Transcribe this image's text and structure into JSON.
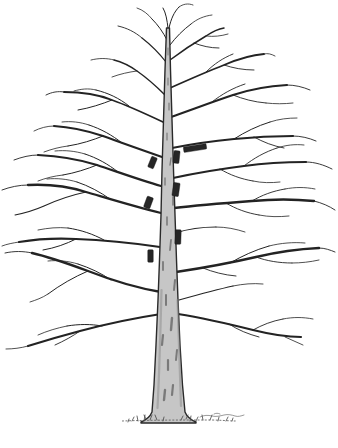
{
  "illustration": {
    "name": "bare-deciduous-tree-pen-and-ink",
    "subject": "leafless tree with dark rectangular placement tags on trunk and branches"
  },
  "colors": {
    "paper": "#ffffff",
    "ink": "#232323",
    "trunk_fill": "#c6c6c6",
    "trunk_edge": "#2a2a2a",
    "bark_shadow": "#3c3c3c",
    "marker_fill": "#262626",
    "ground": "#555555"
  },
  "markers": [
    {
      "id": "branch-bar-right",
      "x": 195,
      "y": 148,
      "width": 23,
      "height": 5.5,
      "angle": -9
    },
    {
      "id": "trunk-right-upper",
      "x": 176.5,
      "y": 157,
      "width": 6,
      "height": 12.5,
      "angle": 6
    },
    {
      "id": "left-upper",
      "x": 152.5,
      "y": 162.5,
      "width": 6,
      "height": 11.5,
      "angle": 22
    },
    {
      "id": "trunk-right-mid",
      "x": 176,
      "y": 189.5,
      "width": 6.5,
      "height": 13.5,
      "angle": 8
    },
    {
      "id": "left-mid",
      "x": 148.5,
      "y": 202.5,
      "width": 6.5,
      "height": 11.5,
      "angle": 20
    },
    {
      "id": "trunk-right-lower",
      "x": 178,
      "y": 237,
      "width": 6,
      "height": 14.5,
      "angle": 2
    },
    {
      "id": "left-lower",
      "x": 150.5,
      "y": 256,
      "width": 5.5,
      "height": 12.5,
      "angle": 0
    }
  ]
}
